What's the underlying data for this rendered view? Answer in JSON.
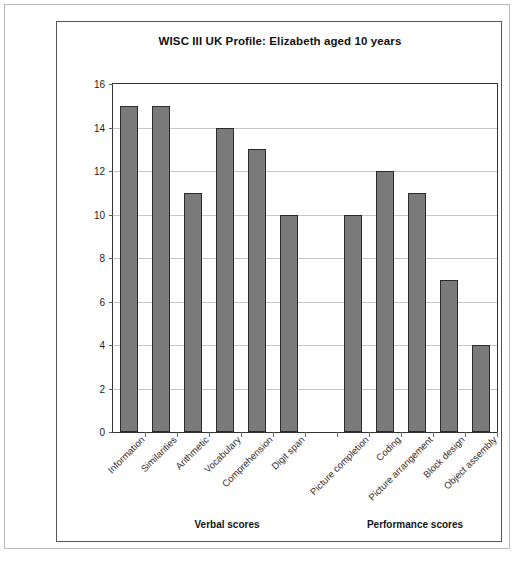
{
  "figure": {
    "caption_faint": ""
  },
  "chart_data": {
    "type": "bar",
    "title": "WISC III UK Profile: Elizabeth aged 10 years",
    "xlabel": "",
    "ylabel": "",
    "ylim": [
      0,
      16
    ],
    "yticks": [
      0,
      2,
      4,
      6,
      8,
      10,
      12,
      14,
      16
    ],
    "grid": true,
    "legend": "none",
    "categories": [
      "Information",
      "Similarities",
      "Arithmetic",
      "Vocabulary",
      "Comprehension",
      "Digit span",
      "",
      "Picture completion",
      "Coding",
      "Picture arrangement",
      "Block design",
      "Object assembly"
    ],
    "values": [
      15,
      15,
      11,
      14,
      13,
      10,
      null,
      10,
      12,
      11,
      7,
      4
    ],
    "bar_color": "#7a7a7a",
    "bar_edge_color": "#2b2b2b",
    "gridline_color": "#c6c6c6",
    "axis_color": "#333333",
    "groups": [
      {
        "label": "Verbal scores",
        "categories": [
          "Information",
          "Similarities",
          "Arithmetic",
          "Vocabulary",
          "Comprehension",
          "Digit span"
        ]
      },
      {
        "label": "Performance scores",
        "categories": [
          "Picture completion",
          "Coding",
          "Picture arrangement",
          "Block design",
          "Object assembly"
        ]
      }
    ]
  }
}
